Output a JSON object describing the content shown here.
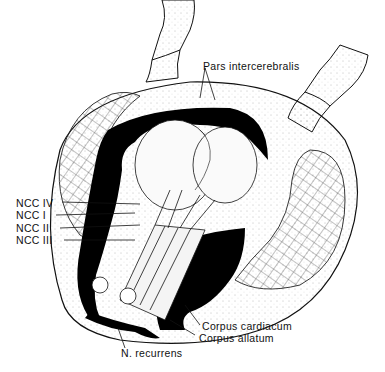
{
  "figure": {
    "colors": {
      "ink": "#111111",
      "fill": "#000000",
      "paper": "#ffffff",
      "stipple": "#888888"
    }
  },
  "labels": {
    "pars_intercerebralis": "Pars intercerebralis",
    "ncc_iv": "NCC IV",
    "ncc_i": "NCC I",
    "ncc_ii": "NCC II",
    "ncc_iii": "NCC III",
    "corpus_cardiacum": "Corpus cardiacum",
    "corpus_allatum": "Corpus allatum",
    "n_recurrens": "N. recurrens"
  }
}
